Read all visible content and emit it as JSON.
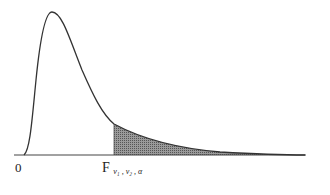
{
  "figure": {
    "type": "F-distribution density curve with shaded upper tail",
    "labels": {
      "origin": "0",
      "critical_main": "F",
      "critical_sub": "ν₁ , ν₂ , α"
    },
    "colors": {
      "curve": "#333333",
      "axis": "#444444",
      "shade": "#7a7a7a"
    }
  }
}
